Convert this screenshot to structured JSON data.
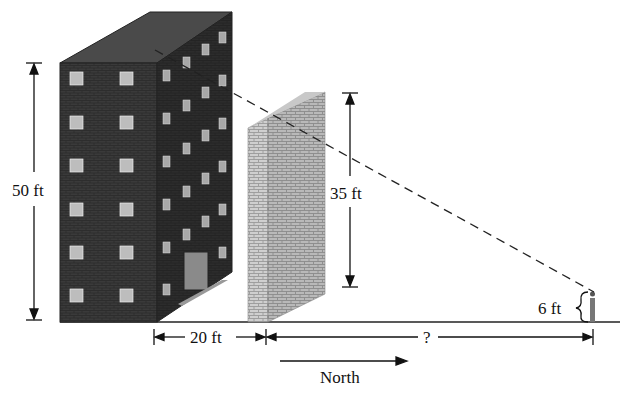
{
  "diagram": {
    "type": "geometry word-problem illustration (similar triangles)",
    "objects": {
      "building": {
        "label": "building",
        "height_label": "50 ft"
      },
      "wall": {
        "label": "brick wall",
        "height_label": "35 ft"
      },
      "person": {
        "label": "person",
        "height_label": "6 ft"
      }
    },
    "dimensions": {
      "building_height": "50 ft",
      "wall_height": "35 ft",
      "person_height": "6 ft",
      "building_to_wall": "20 ft",
      "wall_to_person": "?"
    },
    "direction": {
      "label": "North"
    },
    "sight_line": "dashed line from top of building over top of wall to person's eye"
  }
}
